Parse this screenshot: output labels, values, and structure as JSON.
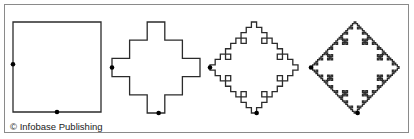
{
  "figure": {
    "stroke_color": "#2b2b2b",
    "dot_color": "#000000",
    "iterations": [
      {
        "level": 0,
        "box": [
          13,
          22,
          88,
          90
        ]
      },
      {
        "level": 1,
        "box": [
          112,
          22,
          88,
          91
        ]
      },
      {
        "level": 2,
        "box": [
          210,
          22,
          88,
          91
        ]
      },
      {
        "level": 3,
        "box": [
          311,
          22,
          88,
          91
        ]
      }
    ]
  },
  "credit": "© Infobase Publishing"
}
